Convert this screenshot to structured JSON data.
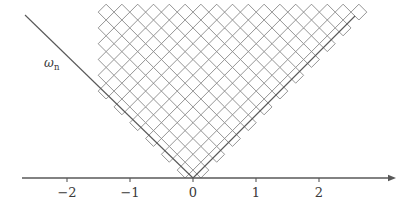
{
  "figure": {
    "background_color": "#ffffff",
    "width": 414,
    "height": 212
  },
  "axis": {
    "name": "horizontal-number-line",
    "color": "#585858",
    "y_pixel": 178,
    "x_start_pixel": 22,
    "x_end_pixel": 396,
    "arrow": "right-arrow",
    "origin_pixel": 193,
    "unit_pixels": 63,
    "tick_height": 4,
    "ticks": [
      {
        "label": "−2",
        "value": -2,
        "x_pixel": 67
      },
      {
        "label": "−1",
        "value": -1,
        "x_pixel": 130
      },
      {
        "label": "0",
        "value": 0,
        "x_pixel": 193
      },
      {
        "label": "1",
        "value": 1,
        "x_pixel": 256
      },
      {
        "label": "2",
        "value": 2,
        "x_pixel": 319
      }
    ]
  },
  "cone": {
    "name": "v-shaped-cone",
    "color": "#585858",
    "apex_pixel": {
      "x": 193,
      "y": 178
    },
    "left_end_pixel": {
      "x": 25,
      "y": 15
    },
    "right_end_pixel": {
      "x": 355,
      "y": 16
    },
    "label": {
      "symbol": "ω",
      "subscript": "n",
      "x_pixel": 44,
      "y_pixel": 57
    }
  },
  "lattice": {
    "name": "diamond-lattice-tiling",
    "description": "Unit squares rotated 45 degrees filling the cone interior, forming a staircase approximation of the two cone edges.",
    "stroke_color": "#666666",
    "fill_color": "#ffffff",
    "stroke_width": 0.7,
    "diamond_half_width_pixel": 7.9,
    "diamond_half_height_pixel": 7.9,
    "rows": 11,
    "left_top_pixel": {
      "x": 103,
      "y": 89
    },
    "right_top_pixel": {
      "x": 310,
      "y": 53
    },
    "row_counts_left": [
      1,
      2,
      3,
      4,
      5,
      6,
      6,
      6,
      6,
      6,
      6
    ],
    "row_counts_right": [
      1,
      2,
      3,
      4,
      5,
      6,
      7,
      8,
      9,
      10,
      11
    ]
  },
  "chart_data": {
    "type": "line",
    "title": "",
    "xlabel": "",
    "ylabel": "",
    "xlim": [
      -2.72,
      3.22
    ],
    "ylim": [
      0,
      2.59
    ],
    "grid": false,
    "legend": "none",
    "annotations": [
      {
        "text": "ωₙ",
        "x": -2.35,
        "y": 1.92
      }
    ],
    "xticks": [
      -2,
      -1,
      0,
      1,
      2
    ],
    "xticklabels": [
      "−2",
      "−1",
      "0",
      "1",
      "2"
    ],
    "series": [
      {
        "name": "cone-left-edge",
        "x": [
          -2.67,
          0
        ],
        "values": [
          2.59,
          0
        ]
      },
      {
        "name": "cone-right-edge",
        "x": [
          0,
          2.57
        ],
        "values": [
          0,
          2.57
        ]
      }
    ]
  }
}
